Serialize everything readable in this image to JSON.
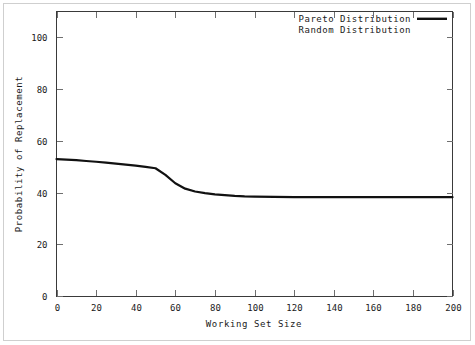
{
  "chart_data": {
    "type": "line",
    "title": "",
    "xlabel": "Working Set Size",
    "ylabel": "Probability of Replacement",
    "xlim": [
      0,
      200
    ],
    "ylim": [
      0,
      110
    ],
    "grid": false,
    "legend_position": "top-right",
    "xticks": [
      0,
      20,
      40,
      60,
      80,
      100,
      120,
      140,
      160,
      180,
      200
    ],
    "xtick_labels": [
      "0",
      "20",
      "40",
      "60",
      "80",
      "100",
      "120",
      "140",
      "160",
      "180",
      "200"
    ],
    "yticks": [
      0,
      20,
      40,
      60,
      80,
      100
    ],
    "ytick_labels": [
      "0",
      "20",
      "40",
      "60",
      "80",
      "100"
    ],
    "series": [
      {
        "name": "Pareto Distribution",
        "color": "#111111",
        "visible": true,
        "x": [
          0,
          5,
          10,
          15,
          20,
          25,
          30,
          35,
          40,
          45,
          50,
          55,
          60,
          65,
          70,
          75,
          80,
          85,
          90,
          95,
          100,
          110,
          120,
          130,
          140,
          150,
          160,
          170,
          180,
          190,
          200
        ],
        "values": [
          52.9,
          52.7,
          52.5,
          52.2,
          51.9,
          51.6,
          51.2,
          50.8,
          50.4,
          49.9,
          49.4,
          46.8,
          43.6,
          41.5,
          40.4,
          39.8,
          39.3,
          39.0,
          38.7,
          38.5,
          38.4,
          38.3,
          38.2,
          38.2,
          38.2,
          38.2,
          38.2,
          38.2,
          38.2,
          38.2,
          38.2
        ]
      },
      {
        "name": "Random Distribution",
        "color": "#ffffff",
        "visible": false,
        "x": [],
        "values": []
      }
    ]
  },
  "legend": {
    "entries": [
      {
        "label": "Pareto Distribution",
        "has_sample": true
      },
      {
        "label": "Random Distribution",
        "has_sample": false
      }
    ]
  },
  "axes": {
    "x_title": "Working Set Size",
    "y_title": "Probability of Replacement"
  },
  "colors": {
    "series_pareto": "#111111",
    "frame": "#3a3a3a",
    "tick": "#6f6f6f",
    "outer_border": "#cfcfcf",
    "background": "#ffffff",
    "text": "#1a1a1a"
  }
}
